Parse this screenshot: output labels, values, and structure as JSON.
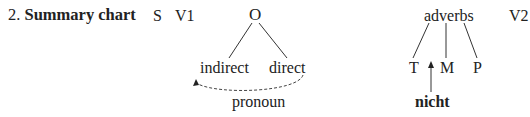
{
  "title": {
    "number": "2.",
    "text": "Summary chart"
  },
  "sequence": {
    "subject": "S",
    "verb1": "V1",
    "object": {
      "label": "O",
      "children": [
        "indirect",
        "direct"
      ],
      "note": "pronoun"
    },
    "adverbs": {
      "label": "adverbs",
      "children": [
        "T",
        "M",
        "P"
      ],
      "insert": "nicht"
    },
    "verb2": "V2"
  },
  "colors": {
    "text": "#222222",
    "lines": "#333333",
    "background": "#ffffff"
  }
}
